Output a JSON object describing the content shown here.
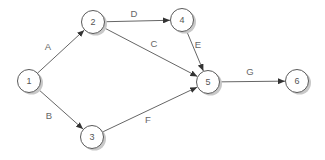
{
  "diagram": {
    "type": "directed-graph",
    "canvas": {
      "width": 325,
      "height": 160,
      "background": "#ffffff"
    },
    "style": {
      "node_fill": "#ffffff",
      "node_stroke": "#5a5a5a",
      "node_shadow": "#c8c8c8",
      "node_radius": 11.5,
      "edge_color": "#666666",
      "arrow_color": "#333333",
      "edge_label_color": "#666666",
      "node_label_color": "#555555"
    },
    "nodes": [
      {
        "id": "1",
        "label": "1",
        "x": 29,
        "y": 81
      },
      {
        "id": "2",
        "label": "2",
        "x": 93,
        "y": 22
      },
      {
        "id": "3",
        "label": "3",
        "x": 92,
        "y": 137
      },
      {
        "id": "4",
        "label": "4",
        "x": 182,
        "y": 20
      },
      {
        "id": "5",
        "label": "5",
        "x": 208,
        "y": 82
      },
      {
        "id": "6",
        "label": "6",
        "x": 297,
        "y": 81
      }
    ],
    "edges": [
      {
        "from": "1",
        "to": "2",
        "label": "A",
        "label_x": 48,
        "label_y": 50
      },
      {
        "from": "1",
        "to": "3",
        "label": "B",
        "label_x": 49,
        "label_y": 119
      },
      {
        "from": "2",
        "to": "4",
        "label": "D",
        "label_x": 134,
        "label_y": 17
      },
      {
        "from": "2",
        "to": "5",
        "label": "C",
        "label_x": 154,
        "label_y": 47
      },
      {
        "from": "4",
        "to": "5",
        "label": "E",
        "label_x": 198,
        "label_y": 48
      },
      {
        "from": "3",
        "to": "5",
        "label": "F",
        "label_x": 148,
        "label_y": 123
      },
      {
        "from": "5",
        "to": "6",
        "label": "G",
        "label_x": 250,
        "label_y": 75
      }
    ]
  }
}
